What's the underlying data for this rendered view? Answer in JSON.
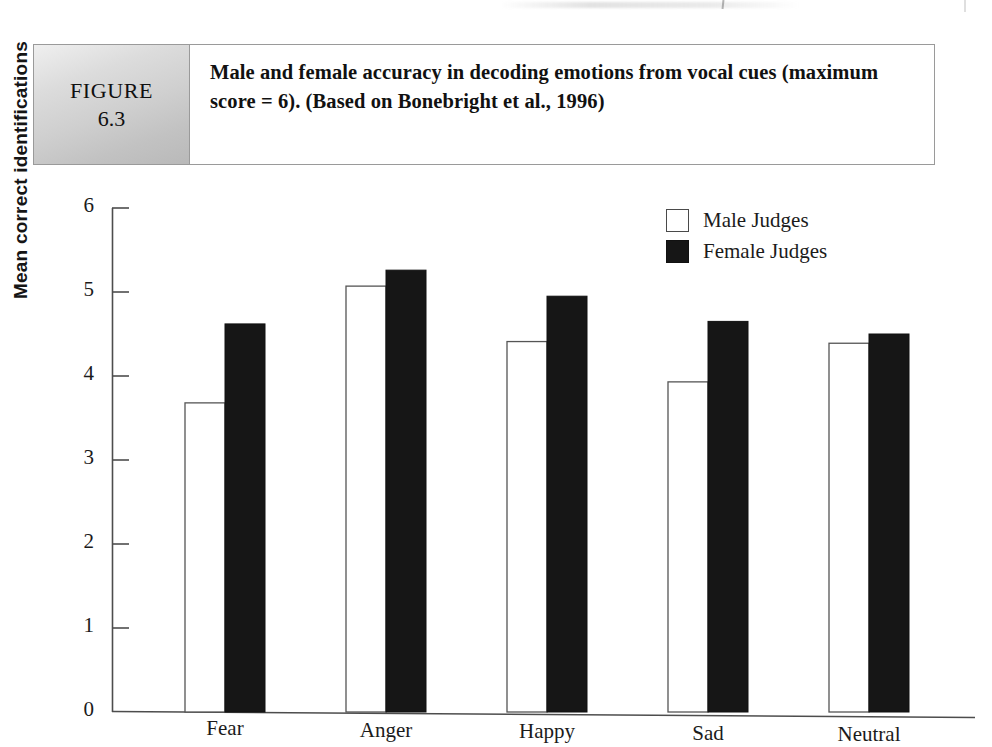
{
  "figure": {
    "tab_word": "FIGURE",
    "tab_number": "6.3",
    "caption": "Male and female accuracy in decoding emotions from vocal cues (maximum score = 6). (Based on Bonebright et al., 1996)"
  },
  "legend": {
    "position": "top-right",
    "items": [
      {
        "label": "Male Judges",
        "swatch": "open-square-white",
        "color": "#ffffff"
      },
      {
        "label": "Female Judges",
        "swatch": "filled-square-black",
        "color": "#161616"
      }
    ]
  },
  "axes": {
    "y_label": "Mean correct identifications",
    "y_ticks": [
      "6",
      "5",
      "4",
      "3",
      "2",
      "1",
      "0"
    ],
    "x_label": ""
  },
  "chart_data": {
    "type": "bar",
    "title": "Male and female accuracy in decoding emotions from vocal cues",
    "xlabel": "",
    "ylabel": "Mean correct identifications",
    "ylim": [
      0,
      6
    ],
    "yticks": [
      0,
      1,
      2,
      3,
      4,
      5,
      6
    ],
    "grid": false,
    "legend_position": "top-right",
    "categories": [
      "Fear",
      "Anger",
      "Happy",
      "Sad",
      "Neutral"
    ],
    "series": [
      {
        "name": "Male Judges",
        "color": "#ffffff",
        "values": [
          3.68,
          5.07,
          4.41,
          3.93,
          4.39
        ]
      },
      {
        "name": "Female Judges",
        "color": "#161616",
        "values": [
          4.62,
          5.26,
          4.95,
          4.65,
          4.5
        ]
      }
    ]
  }
}
